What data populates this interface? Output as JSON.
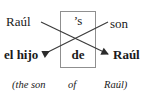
{
  "diagram": {
    "type": "word-order-crossing-diagram",
    "line_color": "#3a3a3a",
    "box_color": "#8a8a8a",
    "text_color": "#1a1a1a",
    "source_row": {
      "left_word": "Raúl",
      "boxed_word": "’s",
      "right_word": "son"
    },
    "target_row": {
      "left_word": "el hijo",
      "boxed_word": "de",
      "right_word": "Raúl"
    },
    "gloss_row": {
      "part_a": "(the son",
      "part_b": "of",
      "part_c": "Raúl)"
    },
    "links": [
      {
        "name": "raul-to-raul",
        "from": "Raúl",
        "to": "Raúl",
        "direction": "down-right"
      },
      {
        "name": "son-to-el-hijo",
        "from": "son",
        "to": "el hijo",
        "direction": "down-left"
      }
    ]
  }
}
